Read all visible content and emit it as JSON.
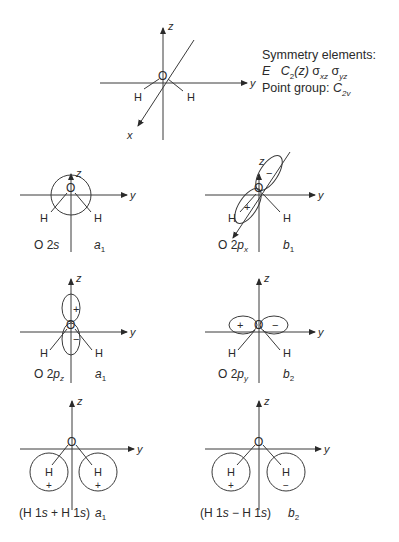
{
  "symmetry_box": {
    "heading": "Symmetry elements:",
    "elements_line": {
      "E": "E",
      "C2": "C",
      "C2_sub": "2",
      "C2_arg": "(z)",
      "sxz": "σ",
      "sxz_sub": "xz",
      "syz": "σ",
      "syz_sub": "yz"
    },
    "point_group_label": "Point group:",
    "point_group": "C",
    "point_group_sub": "2v"
  },
  "axes": {
    "x": "x",
    "y": "y",
    "z": "z"
  },
  "atoms": {
    "O": "O",
    "H": "H"
  },
  "signs": {
    "plus": "+",
    "minus": "−"
  },
  "panels": [
    {
      "id": "o2s",
      "orbital": "O 2s",
      "orbital_main": "O 2",
      "orbital_it": "s",
      "irrep": "a",
      "irrep_sub": "1"
    },
    {
      "id": "o2px",
      "orbital_main": "O 2",
      "orbital_it": "p",
      "orbital_sub": "x",
      "irrep": "b",
      "irrep_sub": "1"
    },
    {
      "id": "o2pz",
      "orbital_main": "O 2",
      "orbital_it": "p",
      "orbital_sub": "z",
      "irrep": "a",
      "irrep_sub": "1"
    },
    {
      "id": "o2py",
      "orbital_main": "O 2",
      "orbital_it": "p",
      "orbital_sub": "y",
      "irrep": "b",
      "irrep_sub": "2"
    },
    {
      "id": "h1s_plus",
      "orbital_pre": "(H 1",
      "orbital_it1": "s",
      "orbital_mid": " + H 1",
      "orbital_it2": "s",
      "orbital_post": ")",
      "irrep": "a",
      "irrep_sub": "1"
    },
    {
      "id": "h1s_minus",
      "orbital_pre": "(H 1",
      "orbital_it1": "s",
      "orbital_mid": " − H 1",
      "orbital_it2": "s",
      "orbital_post": ")",
      "irrep": "b",
      "irrep_sub": "2"
    }
  ],
  "colors": {
    "line": "#3a3a3a",
    "text": "#2a2a2a",
    "background": "#ffffff"
  }
}
